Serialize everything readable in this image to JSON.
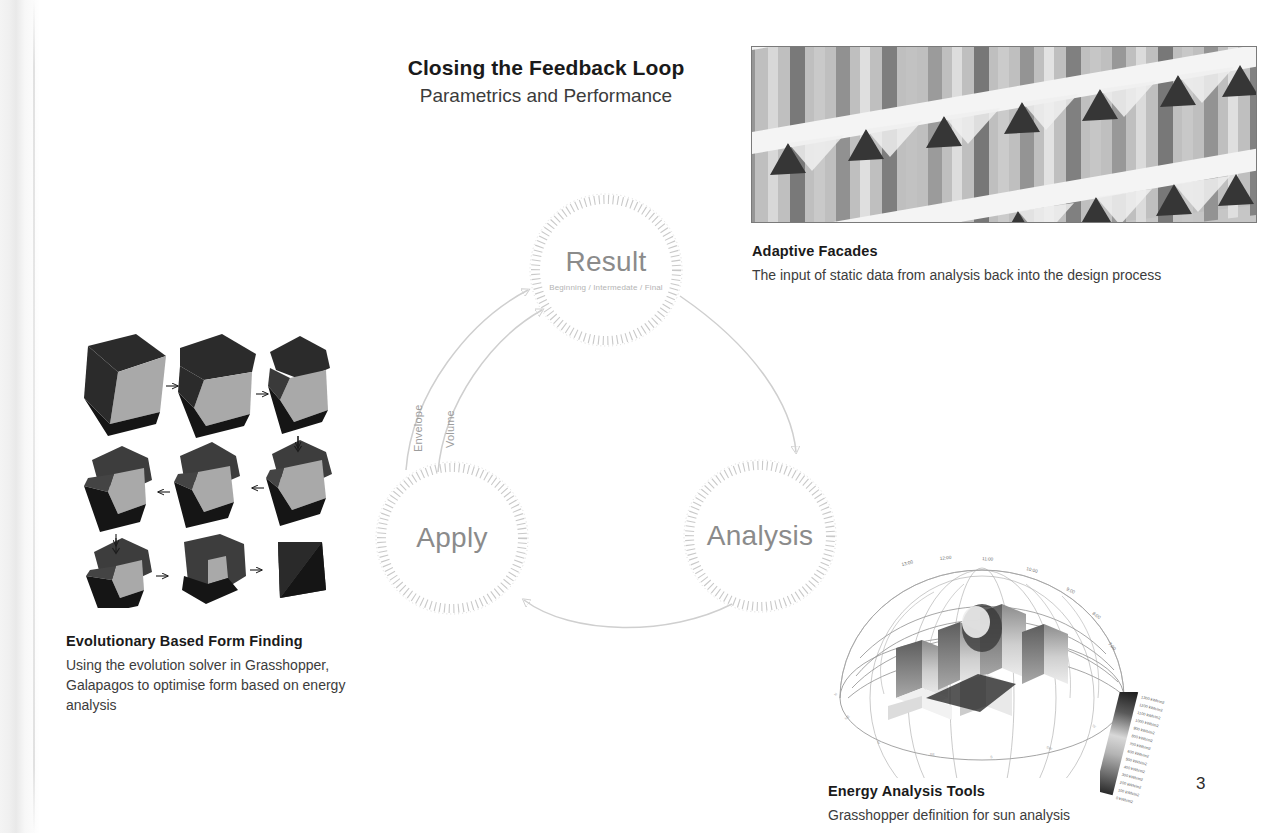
{
  "page": {
    "number": "3",
    "title": "Closing the Feedback Loop",
    "subtitle": "Parametrics and Performance"
  },
  "cycle": {
    "nodes": [
      {
        "label": "Result",
        "sub": "Beginning / Intermedate / Final"
      },
      {
        "label": "Apply",
        "sub": ""
      },
      {
        "label": "Analysis",
        "sub": ""
      }
    ],
    "flow_labels": [
      {
        "label": "Envelope"
      },
      {
        "label": "Volume"
      }
    ],
    "ring_color": "#c9c9c9",
    "arrow_color": "#cfcfcf",
    "label_color": "#8b8b8b"
  },
  "figures": {
    "facade": {
      "alt": "adaptive-facade-photo"
    },
    "forms": {
      "alt": "evolutionary-form-grid",
      "steps": 9
    },
    "sun": {
      "alt": "sun-path-analysis",
      "hour_labels": [
        "13:00",
        "12:00",
        "11:00",
        "10:00",
        "9:00",
        "8:00",
        "7:00"
      ],
      "legend_labels": [
        "1300 kWh/m2",
        "1200 kWh/m2",
        "1100 kWh/m2",
        "1000 kWh/m2",
        "900 kWh/m2",
        "800 kWh/m2",
        "700 kWh/m2",
        "600 kWh/m2",
        "500 kWh/m2",
        "400 kWh/m2",
        "300 kWh/m2",
        "200 kWh/m2",
        "100 kWh/m2",
        "0 kWh/m2"
      ]
    }
  },
  "captions": {
    "facade": {
      "title": "Adaptive Facades",
      "body": "The input of static data from analysis back into the design process"
    },
    "forms": {
      "title": "Evolutionary Based Form Finding",
      "body": "Using the evolution solver in Grasshopper, Galapagos to optimise form based on energy analysis"
    },
    "energy": {
      "title": "Energy Analysis Tools",
      "body": "Grasshopper definition for sun analysis"
    }
  }
}
